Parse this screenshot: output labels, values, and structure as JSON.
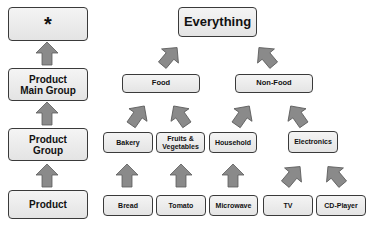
{
  "diagram": {
    "type": "concept-hierarchy",
    "levels": {
      "top": "*",
      "main_group": "Product\nMain Group",
      "group": "Product\nGroup",
      "product": "Product"
    },
    "root": "Everything",
    "main_groups": [
      "Food",
      "Non-Food"
    ],
    "groups": [
      "Bakery",
      "Fruits &\nVegetables",
      "Household",
      "Electronics"
    ],
    "products": [
      "Bread",
      "Tomato",
      "Microwave",
      "TV",
      "CD-Player"
    ],
    "edges": [
      [
        "Food",
        "Everything"
      ],
      [
        "Non-Food",
        "Everything"
      ],
      [
        "Bakery",
        "Food"
      ],
      [
        "Fruits & Vegetables",
        "Food"
      ],
      [
        "Household",
        "Non-Food"
      ],
      [
        "Electronics",
        "Non-Food"
      ],
      [
        "Bread",
        "Bakery"
      ],
      [
        "Tomato",
        "Fruits & Vegetables"
      ],
      [
        "Microwave",
        "Household"
      ],
      [
        "TV",
        "Electronics"
      ],
      [
        "CD-Player",
        "Electronics"
      ]
    ],
    "colors": {
      "box_fill": "#ececec",
      "box_border": "#3a3a3a",
      "arrow_fill": "#8a8a8a",
      "arrow_border": "#555555"
    }
  }
}
